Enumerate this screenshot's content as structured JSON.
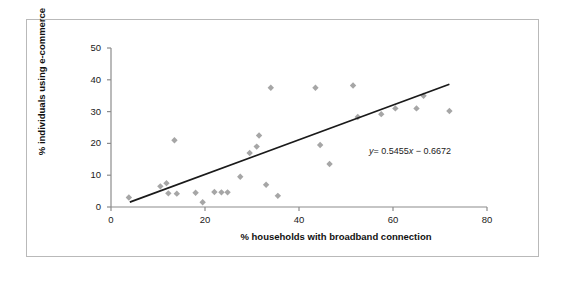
{
  "chart_data": {
    "type": "scatter",
    "title": "",
    "xlabel": "% households with broadband connection",
    "ylabel": "% individuals using e-commerce",
    "xlim": [
      0,
      80
    ],
    "ylim": [
      0,
      50
    ],
    "xticks": [
      0,
      20,
      40,
      60,
      80
    ],
    "yticks": [
      0,
      10,
      20,
      30,
      40,
      50
    ],
    "grid": false,
    "legend": null,
    "marker_color": "#a6a6a6",
    "marker_shape": "diamond",
    "trendline": {
      "type": "linear",
      "slope": 0.5455,
      "intercept": -0.6672,
      "label": "y = 0.5455x − 0.6672",
      "label_y_symbol": "y",
      "label_rest": "= 0.5455",
      "label_x_symbol": "x",
      "label_tail": "− 0.6672",
      "color": "#1a1a1a",
      "x_start": 4,
      "x_end": 72
    },
    "points": [
      {
        "x": 3.8,
        "y": 3.0
      },
      {
        "x": 10.5,
        "y": 6.5
      },
      {
        "x": 11.8,
        "y": 7.5
      },
      {
        "x": 12.2,
        "y": 4.3
      },
      {
        "x": 14.0,
        "y": 4.2
      },
      {
        "x": 13.5,
        "y": 21.0
      },
      {
        "x": 18.0,
        "y": 4.5
      },
      {
        "x": 19.5,
        "y": 1.5
      },
      {
        "x": 22.0,
        "y": 4.7
      },
      {
        "x": 23.5,
        "y": 4.6
      },
      {
        "x": 24.8,
        "y": 4.6
      },
      {
        "x": 27.5,
        "y": 9.5
      },
      {
        "x": 29.5,
        "y": 17.0
      },
      {
        "x": 31.0,
        "y": 19.0
      },
      {
        "x": 31.5,
        "y": 22.5
      },
      {
        "x": 33.0,
        "y": 7.0
      },
      {
        "x": 34.0,
        "y": 37.5
      },
      {
        "x": 35.5,
        "y": 3.5
      },
      {
        "x": 43.5,
        "y": 37.5
      },
      {
        "x": 44.5,
        "y": 19.5
      },
      {
        "x": 46.5,
        "y": 13.5
      },
      {
        "x": 51.5,
        "y": 38.2
      },
      {
        "x": 52.5,
        "y": 28.3
      },
      {
        "x": 57.5,
        "y": 29.2
      },
      {
        "x": 60.5,
        "y": 31.0
      },
      {
        "x": 65.0,
        "y": 31.0
      },
      {
        "x": 66.5,
        "y": 35.0
      },
      {
        "x": 72.0,
        "y": 30.2
      }
    ]
  },
  "axes": {
    "x_tick_labels": [
      "0",
      "20",
      "40",
      "60",
      "80"
    ],
    "y_tick_labels": [
      "0",
      "10",
      "20",
      "30",
      "40",
      "50"
    ]
  }
}
